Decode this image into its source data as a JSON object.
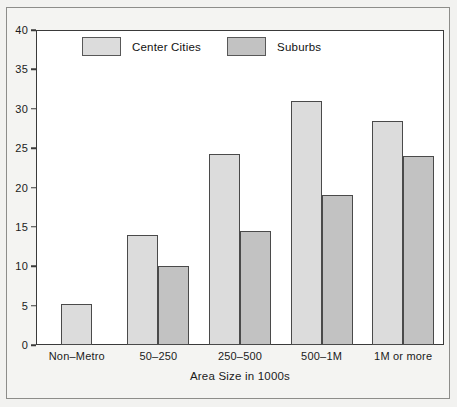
{
  "chart_data": {
    "type": "bar",
    "title": "",
    "subtitle": "",
    "xlabel": "Area Size in 1000s",
    "ylabel": "",
    "categories": [
      "Non–Metro",
      "50–250",
      "250–500",
      "500–1M",
      "1M or more"
    ],
    "series": [
      {
        "name": "Center Cities",
        "color": "#dcdcdc",
        "values": [
          5.2,
          14.0,
          24.3,
          31.0,
          28.4
        ]
      },
      {
        "name": "Suburbs",
        "color": "#c2c2c2",
        "values": [
          null,
          10.0,
          14.5,
          19.0,
          24.0
        ]
      }
    ],
    "ylim": [
      0,
      40
    ],
    "ytick_labels": [
      "0",
      "5",
      "10",
      "15",
      "20",
      "25",
      "30",
      "35",
      "40"
    ],
    "ytick_values": [
      0,
      5,
      10,
      15,
      20,
      25,
      30,
      35,
      40
    ],
    "grid": false,
    "legend_position": "top-left-inside",
    "bar_edge_color": "#4a4a4a",
    "axis_color": "#3a3a3a",
    "plot_background": "#ffffff"
  },
  "legend": {
    "items": [
      {
        "label": "Center Cities",
        "swatch": "legend-swatch-center-cities"
      },
      {
        "label": "Suburbs",
        "swatch": "legend-swatch-suburbs"
      }
    ]
  },
  "axes": {
    "x_title": "Area Size in 1000s"
  }
}
